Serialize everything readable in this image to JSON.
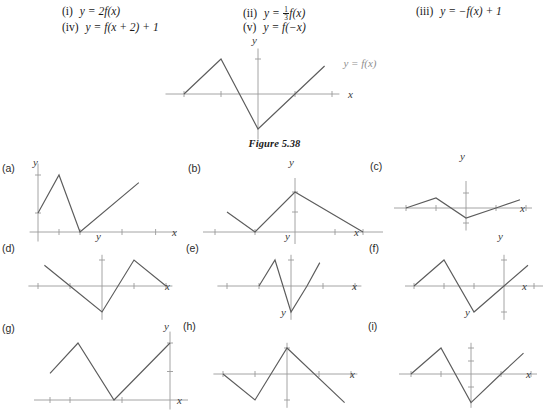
{
  "equations": [
    {
      "numeral": "(i)",
      "text": "y = 2f(x)",
      "has_fraction": false,
      "x": 62,
      "y": 6
    },
    {
      "numeral": "(iv)",
      "text": "y = f(x + 2) + 1",
      "has_fraction": false,
      "x": 62,
      "y": 22
    },
    {
      "numeral": "(ii)",
      "text": "y = ",
      "after": "f(x)",
      "has_fraction": true,
      "frac_num": "1",
      "frac_den": "3",
      "x": 243,
      "y": 6
    },
    {
      "numeral": "(v)",
      "text": "y = f(−x)",
      "has_fraction": false,
      "x": 243,
      "y": 22
    },
    {
      "numeral": "(iii)",
      "text": "y = −f(x) + 1",
      "has_fraction": false,
      "x": 416,
      "y": 6
    }
  ],
  "figure": {
    "caption": "Figure 5.38",
    "function_label": "y = f(x)",
    "axis_x_label": "x",
    "axis_y_label": "y"
  },
  "chart_data": [
    {
      "id": "main",
      "type": "line",
      "title": "Figure 5.38",
      "annotation": "y = f(x)",
      "xlabel": "x",
      "ylabel": "y",
      "xlim": [
        -5,
        4.4
      ],
      "ylim": [
        -2.6,
        2.6
      ],
      "x_ticks": [
        -4,
        -2,
        2,
        4
      ],
      "y_ticks": [
        2
      ],
      "points": [
        [
          -4,
          0
        ],
        [
          -2,
          2
        ],
        [
          0,
          -2
        ],
        [
          2,
          0
        ],
        [
          3.6,
          1.6
        ]
      ],
      "grid": false
    },
    {
      "id": "a",
      "type": "line",
      "label": "(a)",
      "xlabel": "x",
      "ylabel": "y",
      "xlim": [
        -0.4,
        6.6
      ],
      "ylim": [
        -0.5,
        3.6
      ],
      "x_ticks": [
        1,
        2,
        4,
        5.6
      ],
      "y_ticks": [
        1,
        3
      ],
      "points": [
        [
          0,
          1
        ],
        [
          1,
          3
        ],
        [
          2,
          0
        ],
        [
          4.8,
          2.6
        ]
      ],
      "grid": false
    },
    {
      "id": "b",
      "type": "line",
      "label": "(b)",
      "xlabel": "x",
      "ylabel": "y",
      "xlim": [
        -4.6,
        4.4
      ],
      "ylim": [
        -0.6,
        2.7
      ],
      "x_ticks": [
        -4,
        -2,
        2,
        3.4
      ],
      "y_ticks": [
        1,
        2
      ],
      "points": [
        [
          -3.4,
          1
        ],
        [
          -2,
          0
        ],
        [
          0,
          2
        ],
        [
          3.4,
          0
        ]
      ],
      "grid": false
    },
    {
      "id": "c",
      "type": "line",
      "label": "(c)",
      "xlabel": "x",
      "ylabel": "y",
      "xlim": [
        -4.8,
        4.4
      ],
      "ylim": [
        -1.5,
        1.8
      ],
      "x_ticks": [
        -4,
        -2,
        2,
        4
      ],
      "y_ticks": [
        1,
        -1
      ],
      "points": [
        [
          -4,
          0
        ],
        [
          -2,
          0.67
        ],
        [
          0,
          -0.67
        ],
        [
          2,
          0
        ],
        [
          3.6,
          0.55
        ]
      ],
      "grid": false
    },
    {
      "id": "d",
      "type": "line",
      "label": "(d)",
      "xlabel": "x",
      "ylabel": "y",
      "xlim": [
        -4.6,
        4.4
      ],
      "ylim": [
        -2.6,
        2.4
      ],
      "x_ticks": [
        -4,
        -2,
        2,
        4
      ],
      "y_ticks": [
        2
      ],
      "points": [
        [
          -3.6,
          1.6
        ],
        [
          -2,
          0
        ],
        [
          0,
          -2
        ],
        [
          2,
          2
        ],
        [
          4,
          0
        ]
      ],
      "grid": false
    },
    {
      "id": "e",
      "type": "line",
      "label": "(e)",
      "xlabel": "x",
      "ylabel": "y",
      "xlim": [
        -4.6,
        4.4
      ],
      "ylim": [
        -2.6,
        2.4
      ],
      "x_ticks": [
        -4,
        -2,
        2,
        4
      ],
      "y_ticks": [
        2
      ],
      "points": [
        [
          -2,
          0
        ],
        [
          -1,
          2
        ],
        [
          0,
          -2
        ],
        [
          1,
          0
        ],
        [
          1.8,
          1.8
        ]
      ],
      "grid": false
    },
    {
      "id": "f",
      "type": "line",
      "label": "(f)",
      "xlabel": "x",
      "ylabel": "y",
      "xlim": [
        -6.6,
        2.6
      ],
      "ylim": [
        -2.6,
        2.4
      ],
      "x_ticks": [
        -6,
        -4,
        -2,
        2
      ],
      "y_ticks": [
        2,
        -2
      ],
      "points": [
        [
          -6,
          0
        ],
        [
          -4,
          2
        ],
        [
          -2,
          -2
        ],
        [
          0,
          0
        ],
        [
          1.6,
          1.6
        ]
      ],
      "grid": false
    },
    {
      "id": "g",
      "type": "line",
      "label": "(g)",
      "xlabel": "x",
      "ylabel": "y",
      "xlim": [
        -6.8,
        0.9
      ],
      "ylim": [
        -0.5,
        3.6
      ],
      "x_ticks": [
        -6,
        -5,
        -2.4
      ],
      "y_ticks": [
        1.5,
        3
      ],
      "points": [
        [
          -6,
          1.4
        ],
        [
          -4.6,
          3
        ],
        [
          -2.8,
          0
        ],
        [
          0,
          3
        ]
      ],
      "grid": false
    },
    {
      "id": "h",
      "type": "line",
      "label": "(h)",
      "xlabel": "x",
      "ylabel": "y",
      "xlim": [
        -4.6,
        4.4
      ],
      "ylim": [
        -2.6,
        2.4
      ],
      "x_ticks": [
        -4,
        -2,
        2,
        4
      ],
      "y_ticks": [
        2,
        -2
      ],
      "points": [
        [
          -4,
          0
        ],
        [
          -2,
          -2
        ],
        [
          0,
          2
        ],
        [
          3.6,
          -2.2
        ]
      ],
      "grid": false
    },
    {
      "id": "i",
      "type": "line",
      "label": "(i)",
      "xlabel": "x",
      "ylabel": "y",
      "xlim": [
        -4.8,
        4.4
      ],
      "ylim": [
        -2.6,
        2.4
      ],
      "x_ticks": [
        -4,
        -2,
        2,
        4
      ],
      "y_ticks": [
        1,
        2,
        -1
      ],
      "points": [
        [
          -4,
          0
        ],
        [
          -2,
          2
        ],
        [
          0,
          -2.2
        ],
        [
          2,
          0
        ],
        [
          3.5,
          1.6
        ]
      ],
      "grid": false
    }
  ],
  "panels": [
    {
      "id": "main",
      "label": "",
      "left": 196,
      "top": 46,
      "width": 200,
      "height": 92,
      "ox": 62,
      "oy": 48,
      "sx": 18.5,
      "sy": 17.5,
      "ylab_x": 56,
      "ylab_y": -2,
      "xlab_x": 152,
      "xlab_y": 52,
      "label_x": 0,
      "label_y": 0
    },
    {
      "id": "a",
      "label": "(a)",
      "left": 24,
      "top": 170,
      "width": 165,
      "height": 68,
      "ox": 14,
      "oy": 62,
      "sx": 21,
      "sy": 19,
      "ylab_x": 9,
      "ylab_y": -4,
      "xlab_x": 148,
      "xlab_y": 66,
      "label_x": -22,
      "label_y": -8
    },
    {
      "id": "b",
      "label": "(b)",
      "left": 213,
      "top": 170,
      "width": 152,
      "height": 68,
      "ox": 82,
      "oy": 62,
      "sx": 20,
      "sy": 20,
      "ylab_x": 76,
      "ylab_y": -4,
      "xlab_x": 141,
      "xlab_y": 66,
      "label_x": -25,
      "label_y": -8
    },
    {
      "id": "c",
      "label": "(c)",
      "left": 398,
      "top": 170,
      "width": 134,
      "height": 62,
      "ox": 68,
      "oy": 38,
      "sx": 15,
      "sy": 15,
      "ylab_x": 62,
      "ylab_y": -10,
      "xlab_x": 122,
      "xlab_y": 42,
      "label_x": -28,
      "label_y": -10
    },
    {
      "id": "d",
      "label": "(d)",
      "left": 33,
      "top": 252,
      "width": 150,
      "height": 66,
      "ox": 69,
      "oy": 34,
      "sx": 16,
      "sy": 13,
      "ylab_x": 63,
      "ylab_y": -12,
      "xlab_x": 132,
      "xlab_y": 38,
      "label_x": -31,
      "label_y": -10
    },
    {
      "id": "e",
      "label": "(e)",
      "left": 218,
      "top": 252,
      "width": 146,
      "height": 66,
      "ox": 73,
      "oy": 34,
      "sx": 16,
      "sy": 13,
      "ylab_x": 67,
      "ylab_y": -12,
      "xlab_x": 134,
      "xlab_y": 38,
      "label_x": -32,
      "label_y": -10
    },
    {
      "id": "f",
      "label": "(f)",
      "left": 400,
      "top": 252,
      "width": 134,
      "height": 66,
      "ox": 104,
      "oy": 34,
      "sx": 15,
      "sy": 13,
      "ylab_x": 98,
      "ylab_y": -12,
      "xlab_x": 122,
      "xlab_y": 38,
      "label_x": -31,
      "label_y": -10
    },
    {
      "id": "g",
      "label": "(g)",
      "left": 22,
      "top": 334,
      "width": 158,
      "height": 72,
      "ox": 148,
      "oy": 66,
      "sx": 20,
      "sy": 19,
      "ylab_x": 142,
      "ylab_y": -4,
      "xlab_x": 155,
      "xlab_y": 70,
      "label_x": -20,
      "label_y": -12
    },
    {
      "id": "h",
      "label": "(h)",
      "left": 214,
      "top": 334,
      "width": 150,
      "height": 72,
      "ox": 73,
      "oy": 40,
      "sx": 16,
      "sy": 13,
      "ylab_x": 67,
      "ylab_y": -18,
      "xlab_x": 136,
      "xlab_y": 44,
      "label_x": -31,
      "label_y": -14
    },
    {
      "id": "i",
      "label": "(i)",
      "left": 398,
      "top": 334,
      "width": 140,
      "height": 72,
      "ox": 73,
      "oy": 40,
      "sx": 15,
      "sy": 13,
      "ylab_x": 67,
      "ylab_y": -18,
      "xlab_x": 128,
      "xlab_y": 44,
      "label_x": -30,
      "label_y": -14
    }
  ]
}
